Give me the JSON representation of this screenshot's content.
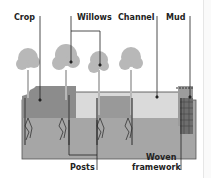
{
  "diagram": {
    "labels": {
      "crop": "Crop",
      "willows": "Willows",
      "channel": "Channel",
      "mud": "Mud",
      "posts": "Posts",
      "woven_framework_line1": "Woven",
      "woven_framework_line2": "framework"
    },
    "colors": {
      "tree": "#b8b8b8",
      "crop": "#8a8a8a",
      "water": "#d9d9d9",
      "soil": "#a6a6a6",
      "soil_dark": "#8f8f8f",
      "roots": "#3a3a3a",
      "lines": "#222222",
      "wall": "#6e6e6e"
    }
  }
}
